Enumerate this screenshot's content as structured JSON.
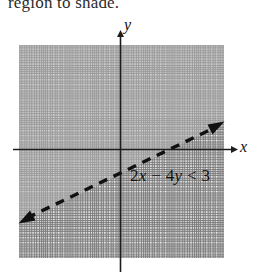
{
  "figure": {
    "caption": "region to shade.",
    "axes": {
      "x_label": "x",
      "y_label": "y"
    },
    "boundary_line": {
      "style": "dashed",
      "arrowheads": "both",
      "equation": "2x - 4y = 3"
    },
    "inequality_label": {
      "lhs_coef": "2",
      "lhs_var": "x",
      "minus": "−",
      "rhs_coef": "4",
      "rhs_var": "y",
      "relation": "<",
      "constant": "3",
      "full": "2x − 4y < 3"
    },
    "shading": {
      "region": "above-left",
      "color": "#b9b9b9"
    },
    "grid": {
      "minor_visible": true,
      "major_visible": true,
      "color": "#787878"
    }
  }
}
